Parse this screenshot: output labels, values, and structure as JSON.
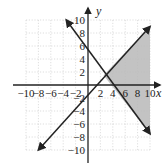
{
  "chart_data": {
    "type": "line",
    "title": "",
    "xlabel": "x",
    "ylabel": "y",
    "xlim": [
      -10,
      10
    ],
    "ylim": [
      -10,
      10
    ],
    "grid": true,
    "x_tick_labels": [
      "-10",
      "-8",
      "-6",
      "-4",
      "-2",
      "2",
      "4",
      "6",
      "8",
      "10"
    ],
    "y_tick_labels": [
      "10",
      "8",
      "6",
      "4",
      "2",
      "-2",
      "-4",
      "-6",
      "-8",
      "-10"
    ],
    "series": [
      {
        "name": "line-decreasing",
        "points": [
          [
            -3.5,
            10
          ],
          [
            0,
            5.2
          ],
          [
            2.5,
            1.5
          ],
          [
            4.8,
            0
          ],
          [
            10,
            -7.5
          ]
        ]
      },
      {
        "name": "line-increasing",
        "points": [
          [
            -8,
            -10
          ],
          [
            0.6,
            0
          ],
          [
            2.5,
            1.5
          ],
          [
            10,
            9
          ]
        ]
      }
    ],
    "shaded_region": {
      "description": "region between the two lines to the right of their intersection, bounded at x=10",
      "vertices": [
        [
          2.5,
          1.5
        ],
        [
          10,
          9
        ],
        [
          10,
          -7.5
        ]
      ],
      "color": "#b8b8b8"
    },
    "intersection": [
      2.5,
      1.5
    ]
  },
  "labels": {
    "x_axis": "x",
    "y_axis": "y"
  }
}
